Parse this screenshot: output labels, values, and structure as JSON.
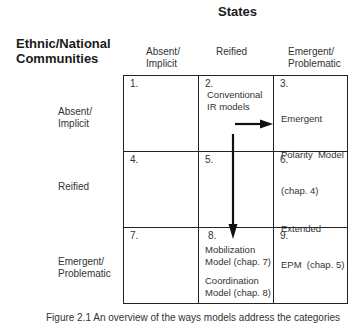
{
  "figure": {
    "column_axis_title": "States",
    "row_axis_title_line1": "Ethnic/National",
    "row_axis_title_line2": "Communities",
    "columns": [
      {
        "line1": "Absent/",
        "line2": "Implicit"
      },
      {
        "line1": "Reified",
        "line2": ""
      },
      {
        "line1": "Emergent/",
        "line2": "Problematic"
      }
    ],
    "rows": [
      {
        "line1": "Absent/",
        "line2": "Implicit"
      },
      {
        "line1": "Reified",
        "line2": ""
      },
      {
        "line1": "Emergent/",
        "line2": "Problematic"
      }
    ],
    "cells": [
      {
        "num": "1.",
        "text": []
      },
      {
        "num": "2.",
        "text": [
          "Conventional",
          "IR models"
        ]
      },
      {
        "num": "3.",
        "text": [
          "Emergent",
          "Polarity  Model",
          "(chap. 4)",
          "Extended",
          "EPM  (chap. 5)"
        ]
      },
      {
        "num": "4.",
        "text": []
      },
      {
        "num": "5.",
        "text": []
      },
      {
        "num": "6.",
        "text": []
      },
      {
        "num": "7.",
        "text": []
      },
      {
        "num": "8.",
        "text": [
          "Mobilization",
          "Model (chap. 7)",
          "Coordination",
          "Model (chap. 8)"
        ]
      },
      {
        "num": "9.",
        "text": []
      }
    ],
    "arrows": [
      {
        "from": "cell-2",
        "to": "cell-3",
        "direction": "right"
      },
      {
        "from": "cell-2",
        "to": "cell-8",
        "direction": "down"
      }
    ],
    "caption": "Figure 2.1  An overview of the ways models address the categories"
  }
}
